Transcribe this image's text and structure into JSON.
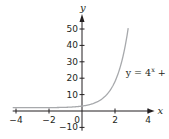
{
  "chart_data": {
    "type": "line",
    "title": "",
    "xlabel": "x",
    "ylabel": "y",
    "xlim": [
      -4.2,
      4.4
    ],
    "ylim": [
      -12,
      58
    ],
    "grid": false,
    "x_ticks": [
      -4,
      -2,
      0,
      2,
      4
    ],
    "x_tick_labels": [
      "−4",
      "−2",
      "0",
      "2",
      "4"
    ],
    "y_ticks": [
      -10,
      10,
      20,
      30,
      40,
      50
    ],
    "y_tick_labels": [
      "−10",
      "10",
      "20",
      "30",
      "40",
      "50"
    ],
    "series": [
      {
        "name": "y = 4^x + 2",
        "function": "4^x + 2",
        "x_range": [
          -4.2,
          2.8
        ],
        "color": "#a7a9ac"
      }
    ],
    "annotations": [
      {
        "text_main": "y = 4",
        "text_sup": "x",
        "text_tail": " + 2",
        "position": "right of curve"
      }
    ]
  }
}
